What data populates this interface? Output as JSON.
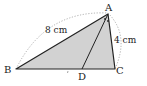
{
  "figure": {
    "type": "triangle",
    "vertices": {
      "A": {
        "label": "A",
        "x": 108,
        "y": 14
      },
      "B": {
        "label": "B",
        "x": 16,
        "y": 69
      },
      "C": {
        "label": "C",
        "x": 115,
        "y": 69
      },
      "D": {
        "label": "D",
        "x": 82,
        "y": 69
      }
    },
    "segments": [
      {
        "from": "A",
        "to": "B",
        "length_label": "8 cm"
      },
      {
        "from": "A",
        "to": "C",
        "length_label": "4 cm"
      },
      {
        "from": "B",
        "to": "C"
      },
      {
        "from": "A",
        "to": "D"
      }
    ],
    "fill_color": "#d2d2d2",
    "stroke_color": "#222222",
    "dotted_arc_color": "#9a9a9a"
  },
  "labels": {
    "A": "A",
    "B": "B",
    "C": "C",
    "D": "D",
    "AB": "8 cm",
    "AC": "4 cm"
  }
}
